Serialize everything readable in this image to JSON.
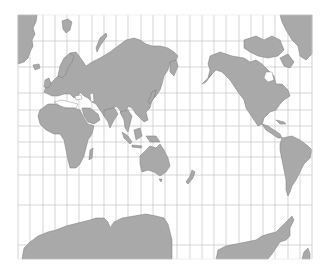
{
  "map": {
    "title": "",
    "projection": "Mercator (Pacific-centered)",
    "background_color": "#ffffff",
    "land_color": "#a9a9a9",
    "coast_color": "#7a7a7a",
    "grid_color": "#c4c4c4",
    "frame": {
      "x": 18,
      "y": 15,
      "width": 294,
      "height": 244
    },
    "graticule": {
      "meridian_count": 25,
      "meridian_x": [
        18,
        30,
        43,
        55,
        67,
        79,
        92,
        104,
        116,
        128,
        141,
        153,
        165,
        177,
        190,
        202,
        214,
        226,
        239,
        251,
        263,
        275,
        288,
        300,
        312
      ],
      "parallel_y": [
        41,
        67,
        93,
        110,
        126,
        142,
        157,
        175,
        205,
        245
      ]
    },
    "landmasses": [
      {
        "name": "Greenland (left)"
      },
      {
        "name": "Europe"
      },
      {
        "name": "Asia"
      },
      {
        "name": "Africa"
      },
      {
        "name": "Madagascar"
      },
      {
        "name": "Arabian Peninsula"
      },
      {
        "name": "India"
      },
      {
        "name": "Southeast Asia"
      },
      {
        "name": "Japan"
      },
      {
        "name": "Indonesia"
      },
      {
        "name": "Australia"
      },
      {
        "name": "New Zealand"
      },
      {
        "name": "North America"
      },
      {
        "name": "Greenland (right)"
      },
      {
        "name": "Canadian Arctic Archipelago"
      },
      {
        "name": "Central America"
      },
      {
        "name": "South America"
      },
      {
        "name": "Antarctica"
      }
    ]
  }
}
